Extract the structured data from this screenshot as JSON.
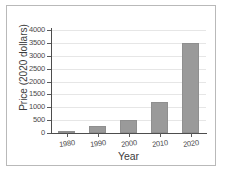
{
  "chart_data": {
    "type": "bar",
    "title": "",
    "xlabel": "Year",
    "ylabel": "Price (2020 dollars)",
    "categories": [
      "1980",
      "1990",
      "2000",
      "2010",
      "2020"
    ],
    "values": [
      75,
      270,
      500,
      1200,
      3500
    ],
    "ylim": [
      0,
      4000
    ],
    "yticks": [
      0,
      500,
      1000,
      1500,
      2000,
      2500,
      3000,
      3500,
      4000
    ],
    "ytick_labels": [
      "0",
      "500",
      "1000",
      "1500",
      "2000",
      "2500",
      "3000",
      "3500",
      "4000"
    ],
    "grid": true,
    "legend": "none",
    "bar_color": "#9a9a9a",
    "grid_color": "#e6e6e6",
    "axis_color": "#4d4d4d"
  }
}
